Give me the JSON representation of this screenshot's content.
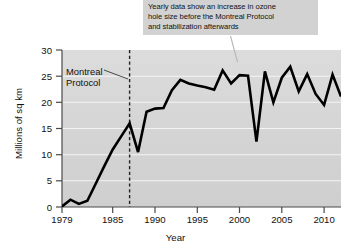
{
  "annotation": {
    "name": "callout-note",
    "lines": [
      "Yearly data show an increase in ozone",
      "hole size before the Montreal Protocol",
      "and stabilization afterwards"
    ],
    "background": "#d2d2d2",
    "leader_target_year": 2000
  },
  "marker": {
    "label_line1": "Montreal",
    "label_line2": "Protocol",
    "year": 1987,
    "style": "dashed-vertical"
  },
  "chart_data": {
    "type": "line",
    "title": "",
    "subtitle": "",
    "xlabel": "Year",
    "ylabel": "Millions of sq km",
    "xlim": [
      1979,
      2012
    ],
    "ylim": [
      0,
      30
    ],
    "xticks": [
      1979,
      1985,
      1990,
      1995,
      2000,
      2005,
      2010
    ],
    "xticklabels": [
      "1979",
      "1985",
      "1990",
      "1995",
      "2000",
      "2005",
      "2010"
    ],
    "yticks": [
      0,
      5,
      10,
      15,
      20,
      25,
      30
    ],
    "yticklabels": [
      "0",
      "5",
      "10",
      "15",
      "20",
      "25",
      "30"
    ],
    "grid": "horizontal",
    "grid_color": "#f2f2f2",
    "plot_background": "#d6d6d6",
    "legend": null,
    "line_color": "#000000",
    "line_width": 2.6,
    "series": [
      {
        "name": "Ozone hole size",
        "x": [
          1979,
          1980,
          1981,
          1982,
          1983,
          1984,
          1985,
          1986,
          1987,
          1988,
          1989,
          1990,
          1991,
          1992,
          1993,
          1994,
          1995,
          1996,
          1997,
          1998,
          1999,
          2000,
          2001,
          2002,
          2003,
          2004,
          2005,
          2006,
          2007,
          2008,
          2009,
          2010,
          2011,
          2012
        ],
        "values": [
          0.1,
          1.4,
          0.6,
          1.2,
          4.5,
          7.8,
          11.0,
          13.5,
          16.0,
          10.5,
          18.2,
          18.8,
          18.9,
          22.3,
          24.3,
          23.6,
          23.2,
          22.9,
          22.4,
          26.1,
          23.6,
          25.2,
          25.1,
          12.5,
          25.9,
          20.0,
          24.7,
          26.8,
          22.1,
          25.4,
          21.6,
          19.5,
          25.3,
          21.1
        ]
      }
    ],
    "annotations": [
      {
        "text": "Yearly data show an increase in ozone hole size before the Montreal Protocol and stabilization afterwards",
        "points_to_year": 2000
      },
      {
        "text": "Montreal Protocol",
        "points_to_year": 1987
      }
    ]
  }
}
